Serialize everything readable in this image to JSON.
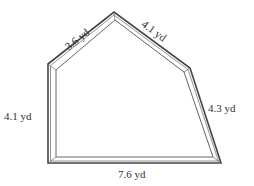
{
  "figure": {
    "type": "pentagon-floor-plan",
    "stroke_color": "#444444",
    "sides": [
      {
        "name": "upper-left-side",
        "label": "3.6 yd"
      },
      {
        "name": "upper-right-side",
        "label": "4.1 yd"
      },
      {
        "name": "right-side",
        "label": "4.3 yd"
      },
      {
        "name": "bottom-side",
        "label": "7.6 yd"
      },
      {
        "name": "left-side",
        "label": "4.1 yd"
      }
    ]
  }
}
